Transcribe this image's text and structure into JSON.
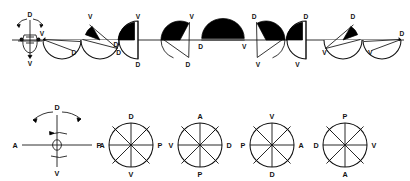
{
  "figure": {
    "title": "",
    "background_color": "#ffffff",
    "ink_color": "#111111",
    "fill_color": "#000000",
    "width": 410,
    "height": 181
  },
  "top_row": {
    "name": "rotation-sequence-row",
    "axis_y": 40,
    "axis_from_x": 12,
    "axis_to_x": 404,
    "schematic": {
      "name": "probe-schematic-top",
      "cx": 30,
      "cy": 40,
      "label_top": "D",
      "label_bottom": "V",
      "rotation_arrows": 2
    },
    "steps": [
      {
        "index": 1,
        "cx": 62,
        "type": "lower-half-sliver",
        "black_fraction": 0.04,
        "label_a": "V",
        "label_a_pos": "upper-left",
        "label_b": "D",
        "label_b_pos": "lower-right"
      },
      {
        "index": 2,
        "cx": 100,
        "type": "lower-half-wedge",
        "black_fraction": 0.18,
        "label_a": "V",
        "label_a_pos": "top",
        "label_b": "D",
        "label_b_pos": "lower-right"
      },
      {
        "index": 3,
        "cx": 137,
        "type": "left-half-upper",
        "black_fraction": 0.5,
        "label_a": "V",
        "label_a_pos": "top",
        "label_b": "D",
        "label_b_pos": "bottom"
      },
      {
        "index": 4,
        "cx": 180,
        "type": "upper-left-sector",
        "black_fraction": 0.78,
        "label_a": "V",
        "label_a_pos": "top-right",
        "label_b": "D",
        "label_b_pos": "bottom"
      },
      {
        "index": 5,
        "cx": 223,
        "type": "upper-half-full",
        "black_fraction": 1.0,
        "label_a": "D",
        "label_a_pos": "left",
        "label_b": "V",
        "label_b_pos": "right"
      },
      {
        "index": 6,
        "cx": 266,
        "type": "upper-right-sector",
        "black_fraction": 0.78,
        "label_a": "D",
        "label_a_pos": "top-left",
        "label_b": "V",
        "label_b_pos": "bottom"
      },
      {
        "index": 7,
        "cx": 305,
        "type": "left-half-upper-r",
        "black_fraction": 0.5,
        "label_a": "D",
        "label_a_pos": "top",
        "label_b": "V",
        "label_b_pos": "bottom"
      },
      {
        "index": 8,
        "cx": 343,
        "type": "lower-half-wedge-r",
        "black_fraction": 0.18,
        "label_a": "D",
        "label_a_pos": "top-right",
        "label_b": "V",
        "label_b_pos": "lower-left"
      },
      {
        "index": 9,
        "cx": 382,
        "type": "lower-half-sliver-r",
        "black_fraction": 0.04,
        "label_a": "D",
        "label_a_pos": "upper-right",
        "label_b": "V",
        "label_b_pos": "lower-left"
      }
    ]
  },
  "bottom_row": {
    "name": "orientation-rose-row",
    "schematic": {
      "name": "probe-schematic-bottom",
      "cx": 57,
      "cy": 145,
      "label_top": "D",
      "label_bottom": "V",
      "label_left": "A",
      "label_right": "P",
      "rotation_arrows": 2
    },
    "roses": [
      {
        "index": 1,
        "cx": 131,
        "cy": 145,
        "r": 22,
        "top": "D",
        "right": "P",
        "bottom": "V",
        "left": "A",
        "filled_half": "upper"
      },
      {
        "index": 2,
        "cx": 200,
        "cy": 145,
        "r": 22,
        "top": "A",
        "right": "D",
        "bottom": "P",
        "left": "V",
        "filled_half": "upper"
      },
      {
        "index": 3,
        "cx": 272,
        "cy": 145,
        "r": 22,
        "top": "V",
        "right": "A",
        "bottom": "D",
        "left": "P",
        "filled_half": "upper"
      },
      {
        "index": 4,
        "cx": 345,
        "cy": 145,
        "r": 22,
        "top": "P",
        "right": "V",
        "bottom": "A",
        "left": "D",
        "filled_half": "upper"
      }
    ]
  },
  "chart_data": {
    "type": "diagram",
    "title": "",
    "description_labels": [
      "D",
      "V",
      "A",
      "P"
    ],
    "series": [
      {
        "name": "top-row-black-fraction",
        "x": [
          1,
          2,
          3,
          4,
          5,
          6,
          7,
          8,
          9
        ],
        "values": [
          0.04,
          0.18,
          0.5,
          0.78,
          1.0,
          0.78,
          0.5,
          0.18,
          0.04
        ]
      }
    ],
    "legend": []
  }
}
